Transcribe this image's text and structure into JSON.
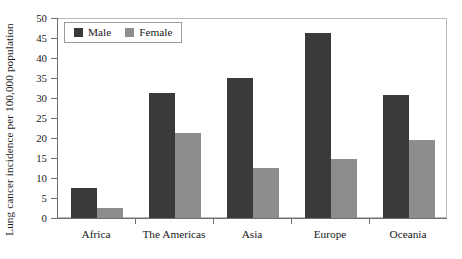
{
  "chart_data": {
    "type": "bar",
    "title": "",
    "xlabel": "",
    "ylabel": "Lung cancer incidence per 100,000 population",
    "categories": [
      "Africa",
      "The Americas",
      "Asia",
      "Europe",
      "Oceania"
    ],
    "series": [
      {
        "name": "Male",
        "color": "#3a3a3a",
        "values": [
          7.6,
          31.3,
          35.0,
          46.2,
          30.8
        ]
      },
      {
        "name": "Female",
        "color": "#8d8d8d",
        "values": [
          2.5,
          21.3,
          12.4,
          14.7,
          19.5
        ]
      }
    ],
    "ylim": [
      0,
      50
    ],
    "yticks": [
      0,
      5,
      10,
      15,
      20,
      25,
      30,
      35,
      40,
      45,
      50
    ],
    "ytick_labels": [
      "0",
      "5",
      "10",
      "15",
      "20",
      "25",
      "30",
      "35",
      "40",
      "45",
      "50"
    ],
    "grid": false,
    "legend_position": "top-left",
    "legend_entries": [
      "Male",
      "Female"
    ]
  },
  "colors": {
    "male": "#3a3a3a",
    "female": "#8d8d8d",
    "axis": "#6f6f6f",
    "frame": "#b9b9b9",
    "text": "#1a1a1a",
    "background": "#ffffff"
  }
}
